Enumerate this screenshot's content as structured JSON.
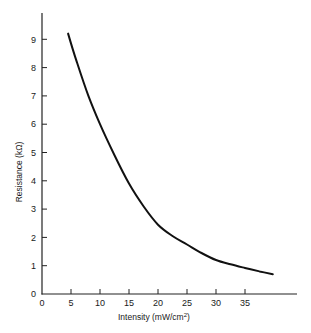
{
  "chart_data": {
    "type": "line",
    "title": "",
    "xlabel": "Intensity (mW/cm²)",
    "ylabel": "Resistance (kΩ)",
    "xlim": [
      0,
      45
    ],
    "ylim": [
      0,
      10
    ],
    "xticks": [
      0,
      5,
      10,
      15,
      20,
      25,
      30,
      35
    ],
    "yticks": [
      0,
      1,
      2,
      3,
      4,
      5,
      6,
      7,
      8,
      9
    ],
    "grid": false,
    "legend": null,
    "series": [
      {
        "name": "Resistance vs Intensity",
        "x": [
          4.5,
          6,
          8,
          10,
          12.5,
          15,
          17.5,
          20,
          22.5,
          25,
          27.5,
          30,
          32.5,
          35,
          37.5,
          39.8
        ],
        "y": [
          9.2,
          8.2,
          7.0,
          6.0,
          4.9,
          3.9,
          3.1,
          2.45,
          2.05,
          1.75,
          1.45,
          1.2,
          1.05,
          0.92,
          0.8,
          0.7
        ]
      }
    ]
  },
  "labels": {
    "x_axis": "Intensity  (mW/cm",
    "x_axis_sup": "2",
    "x_axis_close": ")",
    "y_axis": "Resistance  (kΩ)"
  },
  "colors": {
    "line": "#111111",
    "axis": "#222222",
    "background": "#ffffff"
  }
}
